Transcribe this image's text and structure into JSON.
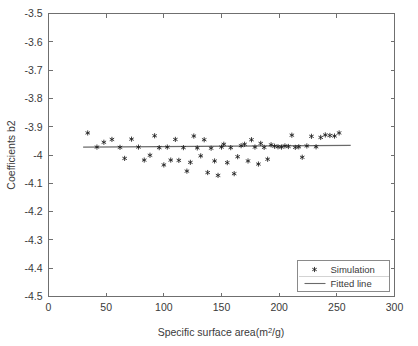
{
  "chart_data": {
    "type": "scatter",
    "title": "",
    "xlabel": "Specific surface area(m²/g)",
    "ylabel": "Coefficients b2",
    "xlim": [
      0,
      300
    ],
    "ylim": [
      -4.5,
      -3.5
    ],
    "xticks": [
      0,
      50,
      100,
      150,
      200,
      250,
      300
    ],
    "xticklabels": [
      "0",
      "50",
      "100",
      "150",
      "200",
      "250",
      "300"
    ],
    "yticks": [
      -4.5,
      -4.4,
      -4.3,
      -4.2,
      -4.1,
      -4.0,
      -3.9,
      -3.8,
      -3.7,
      -3.6,
      -3.5
    ],
    "yticklabels": [
      "-4.5",
      "-4.4",
      "-4.3",
      "-4.2",
      "-4.1",
      "-4",
      "-3.9",
      "-3.8",
      "-3.7",
      "-3.6",
      "-3.5"
    ],
    "grid": false,
    "legend_position": "lower right",
    "legend": [
      {
        "label": "Simulation",
        "marker": "star",
        "color": "#1b1b1b"
      },
      {
        "label": "Fitted line",
        "marker": "line",
        "color": "#6a6a6a"
      }
    ],
    "series": [
      {
        "name": "Simulation",
        "marker": "star",
        "color": "#1b1b1b",
        "points": [
          [
            34,
            -3.922
          ],
          [
            42,
            -3.972
          ],
          [
            48,
            -3.955
          ],
          [
            55,
            -3.945
          ],
          [
            62,
            -3.973
          ],
          [
            66,
            -4.012
          ],
          [
            72,
            -3.944
          ],
          [
            78,
            -3.972
          ],
          [
            83,
            -4.018
          ],
          [
            88,
            -4.001
          ],
          [
            92,
            -3.932
          ],
          [
            96,
            -3.974
          ],
          [
            100,
            -4.035
          ],
          [
            103,
            -3.972
          ],
          [
            106,
            -4.018
          ],
          [
            110,
            -3.945
          ],
          [
            113,
            -4.019
          ],
          [
            117,
            -3.974
          ],
          [
            120,
            -4.057
          ],
          [
            123,
            -4.026
          ],
          [
            126,
            -3.933
          ],
          [
            129,
            -3.975
          ],
          [
            132,
            -4.003
          ],
          [
            135,
            -3.946
          ],
          [
            138,
            -4.062
          ],
          [
            141,
            -3.976
          ],
          [
            144,
            -4.021
          ],
          [
            147,
            -4.072
          ],
          [
            150,
            -3.972
          ],
          [
            152,
            -3.962
          ],
          [
            155,
            -4.027
          ],
          [
            158,
            -3.974
          ],
          [
            161,
            -4.066
          ],
          [
            164,
            -4.006
          ],
          [
            167,
            -3.967
          ],
          [
            170,
            -3.962
          ],
          [
            173,
            -4.021
          ],
          [
            176,
            -3.946
          ],
          [
            179,
            -3.972
          ],
          [
            182,
            -4.032
          ],
          [
            184,
            -3.959
          ],
          [
            187,
            -3.973
          ],
          [
            190,
            -4.015
          ],
          [
            193,
            -3.964
          ],
          [
            196,
            -3.969
          ],
          [
            199,
            -3.971
          ],
          [
            202,
            -3.972
          ],
          [
            205,
            -3.968
          ],
          [
            208,
            -3.97
          ],
          [
            211,
            -3.93
          ],
          [
            214,
            -3.973
          ],
          [
            217,
            -3.971
          ],
          [
            220,
            -4.008
          ],
          [
            224,
            -3.968
          ],
          [
            228,
            -3.934
          ],
          [
            232,
            -3.971
          ],
          [
            236,
            -3.938
          ],
          [
            240,
            -3.929
          ],
          [
            244,
            -3.931
          ],
          [
            248,
            -3.933
          ],
          [
            252,
            -3.922
          ]
        ]
      }
    ],
    "fitted_line": {
      "name": "Fitted line",
      "color": "#6a6a6a",
      "x_start": 30,
      "x_end": 262,
      "y_start": -3.972,
      "y_end": -3.966
    }
  },
  "axes": {
    "y_label": "Coefficients b2",
    "x_label": "Specific surface area(m²/g)"
  },
  "legend": {
    "simulation_label": "Simulation",
    "fitted_label": "Fitted line"
  }
}
